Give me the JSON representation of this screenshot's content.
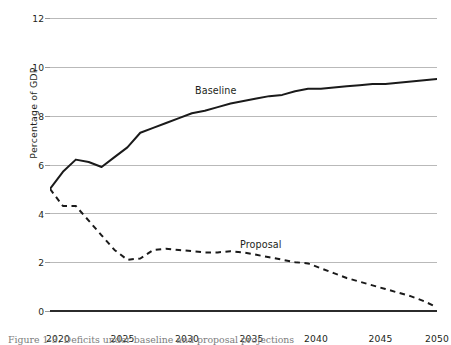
{
  "figure": {
    "caption": "Figure 1-3.  Deficits under baseline and proposal projections"
  },
  "chart_data": {
    "type": "line",
    "title": "",
    "xlabel": "",
    "ylabel": "Percentage of GDP",
    "xlim": [
      2020,
      2050
    ],
    "ylim": [
      0,
      12
    ],
    "grid": true,
    "legend_position": "inline-annotations",
    "xticks": [
      "2020",
      "2025",
      "2030",
      "2035",
      "2040",
      "2045",
      "2050"
    ],
    "yticks": [
      "0",
      "2",
      "4",
      "6",
      "8",
      "10",
      "12"
    ],
    "x": [
      2020,
      2021,
      2022,
      2023,
      2024,
      2025,
      2026,
      2027,
      2028,
      2029,
      2030,
      2031,
      2032,
      2033,
      2034,
      2035,
      2036,
      2037,
      2038,
      2039,
      2040,
      2041,
      2042,
      2043,
      2044,
      2045,
      2046,
      2047,
      2048,
      2049,
      2050
    ],
    "series": [
      {
        "name": "Baseline",
        "style": "solid",
        "color": "#1a1a1a",
        "label_x": 2032,
        "label_y": 9.0,
        "values": [
          5.0,
          5.7,
          6.2,
          6.1,
          5.9,
          6.3,
          6.7,
          7.3,
          7.5,
          7.7,
          7.9,
          8.1,
          8.2,
          8.35,
          8.5,
          8.6,
          8.7,
          8.8,
          8.85,
          9.0,
          9.1,
          9.1,
          9.15,
          9.2,
          9.25,
          9.3,
          9.3,
          9.35,
          9.4,
          9.45,
          9.5
        ]
      },
      {
        "name": "Proposal",
        "style": "dashed",
        "color": "#1a1a1a",
        "label_x": 2036,
        "label_y": 2.85,
        "values": [
          5.0,
          4.3,
          4.3,
          3.7,
          3.1,
          2.5,
          2.1,
          2.15,
          2.5,
          2.55,
          2.5,
          2.45,
          2.4,
          2.4,
          2.45,
          2.4,
          2.3,
          2.2,
          2.1,
          2.0,
          1.95,
          1.75,
          1.55,
          1.35,
          1.2,
          1.05,
          0.9,
          0.75,
          0.6,
          0.4,
          0.15
        ]
      }
    ]
  }
}
